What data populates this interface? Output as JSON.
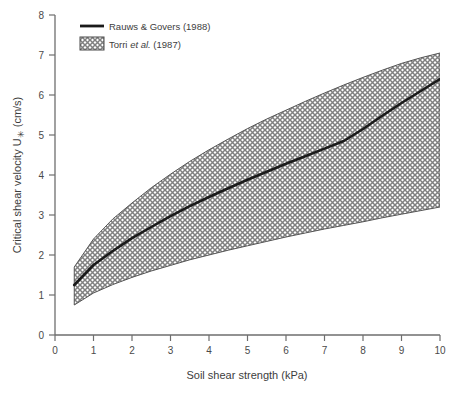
{
  "chart_data": {
    "type": "line",
    "title": "",
    "xlabel": "Soil shear strength (kPa)",
    "ylabel": "Critical shear velocity U✳ (cm/s)",
    "ylabel_parts": {
      "pre": "Critical shear velocity U",
      "symbol": "✳",
      "post": " (cm/s)"
    },
    "xlim": [
      0,
      10
    ],
    "ylim": [
      0,
      8
    ],
    "xticks": [
      0,
      1,
      2,
      3,
      4,
      5,
      6,
      7,
      8,
      9,
      10
    ],
    "yticks": [
      0,
      1,
      2,
      3,
      4,
      5,
      6,
      7,
      8
    ],
    "xtick_labels": [
      "0",
      "1",
      "2",
      "3",
      "4",
      "5",
      "6",
      "7",
      "8",
      "9",
      "10"
    ],
    "ytick_labels": [
      "0",
      "1",
      "2",
      "3",
      "4",
      "5",
      "6",
      "7",
      "8"
    ],
    "grid": false,
    "frame": "left-bottom",
    "legend_position": "top-left",
    "series": [
      {
        "name": "Rauws & Govers (1988)",
        "type": "line",
        "style": "solid-thick-black",
        "color": "#1a1a1a",
        "x": [
          0.5,
          1.0,
          1.5,
          2.0,
          2.5,
          3.0,
          3.5,
          4.0,
          4.5,
          5.0,
          5.5,
          6.0,
          6.5,
          7.0,
          7.5,
          8.0,
          8.5,
          9.0,
          9.5,
          10.0
        ],
        "y": [
          1.25,
          1.75,
          2.1,
          2.42,
          2.7,
          2.97,
          3.22,
          3.45,
          3.67,
          3.88,
          4.08,
          4.28,
          4.47,
          4.66,
          4.85,
          5.15,
          5.48,
          5.8,
          6.1,
          6.4
        ]
      },
      {
        "name": "Torri et al. (1987)",
        "type": "band",
        "style": "crosshatch",
        "color": "#4d4d4d",
        "x": [
          0.5,
          1.0,
          1.5,
          2.0,
          2.5,
          3.0,
          3.5,
          4.0,
          4.5,
          5.0,
          5.5,
          6.0,
          6.5,
          7.0,
          7.5,
          8.0,
          8.5,
          9.0,
          9.5,
          10.0
        ],
        "y_upper": [
          1.7,
          2.4,
          2.9,
          3.3,
          3.68,
          4.02,
          4.34,
          4.63,
          4.9,
          5.16,
          5.4,
          5.62,
          5.84,
          6.05,
          6.25,
          6.44,
          6.62,
          6.79,
          6.93,
          7.05
        ],
        "y_lower": [
          0.75,
          1.05,
          1.26,
          1.44,
          1.6,
          1.74,
          1.88,
          2.0,
          2.12,
          2.23,
          2.34,
          2.45,
          2.55,
          2.65,
          2.74,
          2.83,
          2.93,
          3.02,
          3.11,
          3.2
        ]
      }
    ],
    "legend_entries": [
      {
        "label": "Rauws & Govers (1988)",
        "marker": "line",
        "italic_part": ""
      },
      {
        "label": "Torri et al. (1987)",
        "marker": "hatch-swatch",
        "italic_part": "et al."
      }
    ]
  },
  "legend": {
    "entry_1": {
      "pre": "Rauws & Govers (1988)"
    },
    "entry_2": {
      "pre": "Torri ",
      "ital": "et al.",
      "post": " (1987)"
    }
  },
  "colors": {
    "background": "#ffffff",
    "axis": "#6e6e6e",
    "line": "#1a1a1a",
    "hatch": "#4d4d4d",
    "text": "#3d3d3d"
  }
}
